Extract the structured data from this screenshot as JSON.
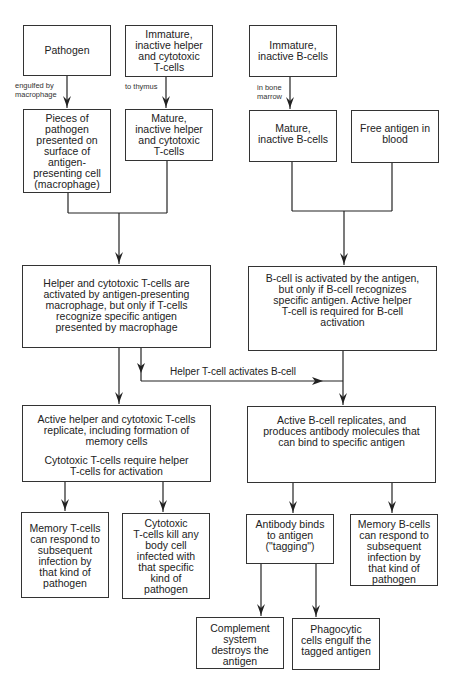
{
  "diagram": {
    "type": "flowchart",
    "topic": "Immune response: T-cell and B-cell activation",
    "nodes": {
      "pathogen": {
        "lines": [
          "Pathogen"
        ]
      },
      "immature_t": {
        "lines": [
          "Immature,",
          "inactive helper",
          "and cytotoxic",
          "T-cells"
        ]
      },
      "immature_b": {
        "lines": [
          "Immature,",
          "inactive B-cells"
        ]
      },
      "pieces": {
        "lines": [
          "Pieces of",
          "pathogen",
          "presented on",
          "surface of",
          "antigen-",
          "presenting cell",
          "(macrophage)"
        ]
      },
      "mature_t": {
        "lines": [
          "Mature,",
          "inactive helper",
          "and cytotoxic",
          "T-cells"
        ]
      },
      "mature_b": {
        "lines": [
          "Mature,",
          "inactive B-cells"
        ]
      },
      "free_antigen": {
        "lines": [
          "Free antigen in",
          "blood"
        ]
      },
      "t_activated": {
        "lines": [
          "Helper and cytotoxic T-cells are",
          "activated by antigen-presenting",
          "macrophage, but only if T-cells",
          "recognize specific antigen",
          "presented by macrophage"
        ]
      },
      "b_activated": {
        "lines": [
          "B-cell is activated by the antigen,",
          "but only if B-cell recognizes",
          "specific antigen. Active helper",
          "T-cell is required for B-cell",
          "activation"
        ]
      },
      "t_replicate": {
        "lines": [
          "Active helper and cytotoxic T-cells",
          "replicate, including formation of",
          "memory cells"
        ],
        "lines2": [
          "Cytotoxic T-cells require helper",
          "T-cells for activation"
        ]
      },
      "b_replicate": {
        "lines": [
          "Active B-cell replicates, and",
          "produces antibody molecules that",
          "can bind to specific antigen"
        ]
      },
      "memory_t": {
        "lines": [
          "Memory T-cells",
          "can respond to",
          "subsequent",
          "infection by",
          "that kind of",
          "pathogen"
        ]
      },
      "cytotoxic_kill": {
        "lines": [
          "Cytotoxic",
          "T-cells kill any",
          "body cell",
          "infected with",
          "that specific",
          "kind of",
          "pathogen"
        ]
      },
      "antibody_binds": {
        "lines": [
          "Antibody binds",
          "to antigen",
          "(\"tagging\")"
        ]
      },
      "memory_b": {
        "lines": [
          "Memory B-cells",
          "can respond to",
          "subsequent",
          "infection by",
          "that kind of",
          "pathogen"
        ]
      },
      "complement": {
        "lines": [
          "Complement",
          "system",
          "destroys the",
          "antigen"
        ]
      },
      "phagocytic": {
        "lines": [
          "Phagocytic",
          "cells engulf the",
          "tagged antigen"
        ]
      }
    },
    "edge_labels": {
      "engulfed": [
        "engulfed by",
        "macrophage"
      ],
      "thymus": [
        "to thymus"
      ],
      "bone_marrow": [
        "in bone",
        "marrow"
      ],
      "helper_activates_b": "Helper T-cell activates B-cell"
    },
    "edges": [
      {
        "from": "pathogen",
        "to": "pieces",
        "label": "engulfed by macrophage"
      },
      {
        "from": "immature_t",
        "to": "mature_t",
        "label": "to thymus"
      },
      {
        "from": "immature_b",
        "to": "mature_b",
        "label": "in bone marrow"
      },
      {
        "from": [
          "pieces",
          "mature_t"
        ],
        "to": "t_activated"
      },
      {
        "from": [
          "mature_b",
          "free_antigen"
        ],
        "to": "b_activated"
      },
      {
        "from": "t_activated",
        "to": "t_replicate"
      },
      {
        "from": "t_activated",
        "to": "b_replicate",
        "label": "Helper T-cell activates B-cell"
      },
      {
        "from": "b_activated",
        "to": "b_replicate"
      },
      {
        "from": "t_replicate",
        "to": "memory_t"
      },
      {
        "from": "t_replicate",
        "to": "cytotoxic_kill"
      },
      {
        "from": "b_replicate",
        "to": "antibody_binds"
      },
      {
        "from": "b_replicate",
        "to": "memory_b"
      },
      {
        "from": "antibody_binds",
        "to": "complement"
      },
      {
        "from": "antibody_binds",
        "to": "phagocytic"
      }
    ],
    "colors": {
      "line": "#222222",
      "box_border": "#333333",
      "text": "#222222",
      "background": "#ffffff"
    }
  }
}
